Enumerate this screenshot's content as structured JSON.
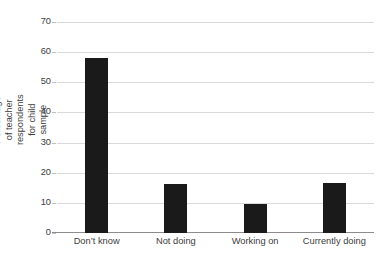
{
  "chart_data": {
    "type": "bar",
    "title": "",
    "subtitle": "",
    "xlabel": "",
    "ylabel": "Percentage of teacher respondents for child sample",
    "categories": [
      "Don’t know",
      "Not doing",
      "Working on",
      "Currently doing"
    ],
    "values": [
      58,
      16.2,
      9.5,
      16.5
    ],
    "series": [
      {
        "name": "Percentage of teacher respondents for child sample",
        "values": [
          58,
          16.2,
          9.5,
          16.5
        ]
      }
    ],
    "ylim": [
      0,
      70
    ],
    "ytick_labels": [
      "0",
      "10",
      "20",
      "30",
      "40",
      "50",
      "60",
      "70"
    ],
    "ytick_values": [
      0,
      10,
      20,
      30,
      40,
      50,
      60,
      70
    ],
    "grid": "horizontal",
    "legend": "none",
    "bar_color": "#1a1a1a",
    "gridline_color": "#d9d9d9",
    "axis_color": "#8c8c8c",
    "text_color": "#3d3d3d",
    "background": "#ffffff"
  }
}
